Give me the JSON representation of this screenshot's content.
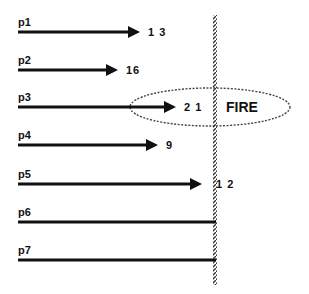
{
  "diagram": {
    "barrier_label": "FIRE",
    "processes": [
      {
        "label": "p1",
        "value": "1 3",
        "y": 32,
        "end": 140,
        "arrow": true
      },
      {
        "label": "p2",
        "value": "16",
        "y": 70,
        "end": 118,
        "arrow": true
      },
      {
        "label": "p3",
        "value": "2 1",
        "y": 107,
        "end": 176,
        "arrow": true
      },
      {
        "label": "p4",
        "value": "9",
        "y": 145,
        "end": 158,
        "arrow": true
      },
      {
        "label": "p5",
        "value": "1 2",
        "y": 184,
        "end": 202,
        "arrow": true
      },
      {
        "label": "p6",
        "value": "",
        "y": 222,
        "end": 216,
        "arrow": false
      },
      {
        "label": "p7",
        "value": "",
        "y": 260,
        "end": 216,
        "arrow": false
      }
    ]
  }
}
